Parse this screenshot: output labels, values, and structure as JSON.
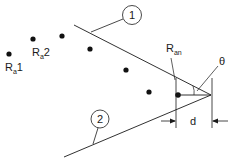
{
  "diagram": {
    "type": "geometric-schematic",
    "colors": {
      "stroke": "#1a1a1a",
      "background": "#ffffff"
    },
    "labels": {
      "ra1_main": "R",
      "ra1_sub": "a",
      "ra1_suffix": "1",
      "ra2_main": "R",
      "ra2_sub": "a",
      "ra2_suffix": "2",
      "ran_main": "R",
      "ran_sub": "an",
      "theta": "θ",
      "d": "d",
      "callout_1": "1",
      "callout_2": "2"
    },
    "points": [
      {
        "id": "Ra1",
        "x": 9,
        "y": 54
      },
      {
        "id": "Ra2",
        "x": 33,
        "y": 39
      },
      {
        "id": "p3",
        "x": 62,
        "y": 36
      },
      {
        "id": "p4",
        "x": 90,
        "y": 49
      },
      {
        "id": "p5",
        "x": 126,
        "y": 70
      },
      {
        "id": "p6",
        "x": 149,
        "y": 92
      },
      {
        "id": "Ran",
        "x": 178,
        "y": 95
      }
    ],
    "lines": [
      {
        "id": "line-1",
        "label": "1"
      },
      {
        "id": "line-2",
        "label": "2"
      }
    ]
  }
}
